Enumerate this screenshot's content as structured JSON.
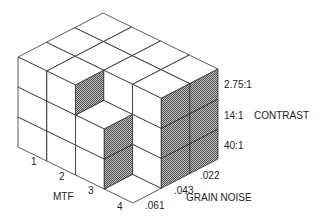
{
  "diagram": {
    "type": "isometric-cube-stack",
    "axes": {
      "mtf": {
        "title": "MTF",
        "ticks": [
          "1",
          "2",
          "3",
          "4"
        ]
      },
      "grain_noise": {
        "title": "GRAIN NOISE",
        "ticks": [
          ".061",
          ".043",
          ".022"
        ]
      },
      "contrast": {
        "title": "CONTRAST",
        "ticks_top_to_bottom": [
          "2.75:1",
          "14:1",
          "40:1"
        ]
      }
    },
    "column_heights_by_mtf": [
      {
        "mtf": "1",
        "heights": [
          3,
          3,
          3
        ]
      },
      {
        "mtf": "2",
        "heights": [
          3,
          3,
          3
        ]
      },
      {
        "mtf": "3",
        "heights": [
          2,
          3,
          3
        ]
      },
      {
        "mtf": "4",
        "heights": [
          0,
          3,
          3
        ]
      }
    ],
    "colors": {
      "line": "#333333",
      "face": "#ffffff",
      "hatch_dark": "#555555",
      "hatch_light": "#bbbbbb"
    }
  }
}
